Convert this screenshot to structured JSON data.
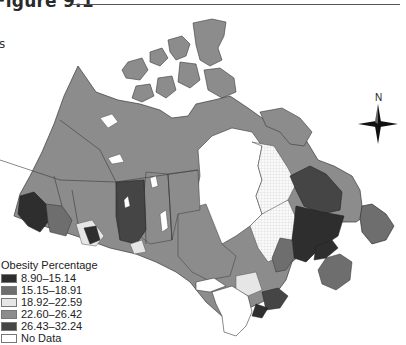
{
  "figure": {
    "title": "Figure 9.1",
    "side_label": "s"
  },
  "compass": {
    "north_label": "N"
  },
  "legend": {
    "title": "Obesity Percentage",
    "items": [
      {
        "label": "8.90–15.14",
        "color": "#2e2e2e"
      },
      {
        "label": "15.15–18.91",
        "color": "#6e6e6e"
      },
      {
        "label": "18.92–22.59",
        "color": "#e6e6e6"
      },
      {
        "label": "22.60–26.42",
        "color": "#8c8c8c"
      },
      {
        "label": "26.43–32.24",
        "color": "#454545"
      },
      {
        "label": "No Data",
        "color": "#ffffff"
      }
    ]
  },
  "map": {
    "subject": "Canada health regions",
    "colors": {
      "land_default": "#8c8c8c",
      "water": "#ffffff",
      "border": "#3a3a3a",
      "dark_region": "#454545",
      "darkest_region": "#2e2e2e",
      "light_region": "#e6e6e6",
      "mid_region": "#6e6e6e"
    }
  }
}
